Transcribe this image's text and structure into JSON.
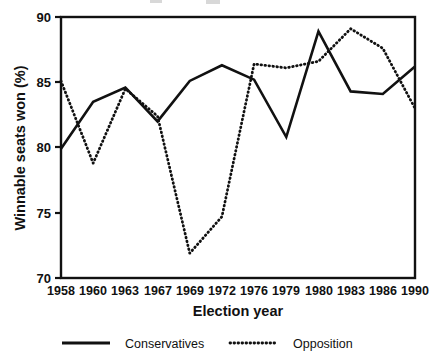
{
  "chart_data": {
    "type": "line",
    "title": "",
    "xlabel": "Election year",
    "ylabel": "Winnable seats won (%)",
    "categories": [
      "1958",
      "1960",
      "1963",
      "1967",
      "1969",
      "1972",
      "1976",
      "1979",
      "1980",
      "1983",
      "1986",
      "1990"
    ],
    "ylim": [
      70,
      90
    ],
    "yticks": [
      70,
      75,
      80,
      85,
      90
    ],
    "ytick_labels": [
      "70",
      "75",
      "80",
      "85",
      "90"
    ],
    "grid": false,
    "legend_position": "bottom",
    "series": [
      {
        "name": "Conservatives",
        "style": "solid",
        "color": "#111111",
        "values": [
          79.9,
          83.5,
          84.6,
          82.0,
          85.1,
          86.3,
          85.2,
          80.8,
          88.9,
          84.3,
          84.1,
          86.2
        ]
      },
      {
        "name": "Opposition",
        "style": "dotted",
        "color": "#111111",
        "values": [
          85.1,
          78.8,
          84.5,
          82.4,
          71.9,
          74.7,
          86.4,
          86.1,
          86.6,
          89.1,
          87.6,
          83.0
        ]
      }
    ]
  },
  "axes": {
    "y_title": "Winnable seats won (%)",
    "x_title": "Election year",
    "y_tick_0": "70",
    "y_tick_1": "75",
    "y_tick_2": "80",
    "y_tick_3": "85",
    "y_tick_4": "90",
    "x_tick_0": "1958",
    "x_tick_1": "1960",
    "x_tick_2": "1963",
    "x_tick_3": "1967",
    "x_tick_4": "1969",
    "x_tick_5": "1972",
    "x_tick_6": "1976",
    "x_tick_7": "1979",
    "x_tick_8": "1980",
    "x_tick_9": "1983",
    "x_tick_10": "1986",
    "x_tick_11": "1990"
  },
  "legend": {
    "entry_conservatives": "Conservatives",
    "entry_opposition": "Opposition"
  },
  "colors": {
    "ink": "#111111",
    "background": "#ffffff"
  }
}
